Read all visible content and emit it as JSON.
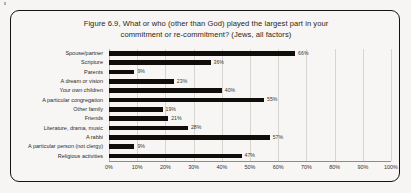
{
  "figure": {
    "title_line1": "Figure 6.9, What or who (other than God) played the largest part in your",
    "title_line2": "commitment or re-commitment? (Jews, all factors)"
  },
  "colors": {
    "bar": "#100d0b",
    "grid": "#d7d5d2",
    "page_background": "#f6f5f3",
    "frame": "#15120f",
    "text": "#2b2722"
  },
  "chart_data": {
    "type": "bar",
    "orientation": "horizontal",
    "title": "Figure 6.9, What or who (other than God) played the largest part in your commitment or re-commitment? (Jews, all factors)",
    "xlabel": "",
    "ylabel": "",
    "xlim": [
      0,
      100
    ],
    "grid": true,
    "legend": false,
    "value_suffix": "%",
    "categories": [
      "Spouse/partner",
      "Scripture",
      "Parents",
      "A dream or vision",
      "Your own children",
      "A particular congregation",
      "Other family",
      "Friends",
      "Literature, drama, music",
      "A rabbi",
      "A particular person (not clergy)",
      "Religious activities"
    ],
    "values": [
      66,
      36,
      9,
      23,
      40,
      55,
      19,
      21,
      28,
      57,
      9,
      47
    ],
    "value_labels": [
      "66%",
      "36%",
      "9%",
      "23%",
      "40%",
      "55%",
      "19%",
      "21%",
      "28%",
      "57%",
      "9%",
      "47%"
    ],
    "xticks": [
      0,
      10,
      20,
      30,
      40,
      50,
      60,
      70,
      80,
      90,
      100
    ],
    "xtick_labels": [
      "0%",
      "10%",
      "20%",
      "30%",
      "40%",
      "50%",
      "60%",
      "70%",
      "80%",
      "90%",
      "100%"
    ]
  }
}
